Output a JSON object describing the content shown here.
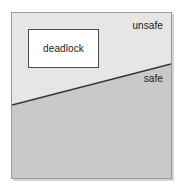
{
  "figure": {
    "type": "region-diagram"
  },
  "regions": {
    "unsafe": {
      "label": "unsafe",
      "fill_color": "#e6e6e6",
      "position": "upper area above the diagonal boundary"
    },
    "safe": {
      "label": "safe",
      "fill_color": "#c9c9c9",
      "position": "lower area below the diagonal boundary"
    }
  },
  "deadlock_box": {
    "label": "deadlock",
    "fill_color": "#ffffff",
    "border_color": "#4a4a4a"
  },
  "boundary": {
    "name": "safe-unsafe-boundary",
    "color": "#333333",
    "left_y": 92,
    "right_y": 51
  },
  "frame": {
    "border_color": "#9a9a9a",
    "background_color": "#e6e6e6"
  }
}
